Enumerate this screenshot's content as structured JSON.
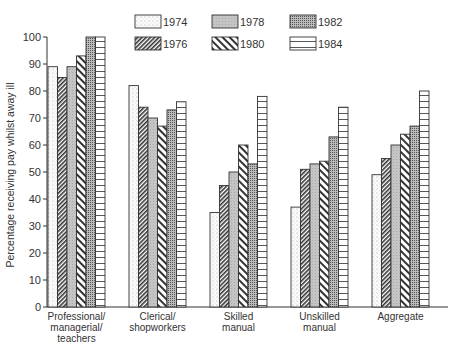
{
  "chart_data": {
    "type": "bar",
    "title": "",
    "xlabel": "",
    "ylabel": "Percentage receiving pay whilst away ill",
    "ylim": [
      0,
      100
    ],
    "yticks": [
      0,
      10,
      20,
      30,
      40,
      50,
      60,
      70,
      80,
      90,
      100
    ],
    "grid": false,
    "legend_position": "top",
    "categories": [
      [
        "Professional/",
        "managerial/",
        "teachers"
      ],
      [
        "Clerical/",
        "shopworkers"
      ],
      [
        "Skilled",
        "manual"
      ],
      [
        "Unskilled",
        "manual"
      ],
      [
        "Aggregate"
      ]
    ],
    "series": [
      {
        "name": "1974",
        "pattern": "dots",
        "values": [
          89,
          82,
          35,
          37,
          49
        ]
      },
      {
        "name": "1976",
        "pattern": "dense-diagonal",
        "values": [
          85,
          74,
          45,
          51,
          55
        ]
      },
      {
        "name": "1978",
        "pattern": "light-grey",
        "values": [
          89,
          70,
          50,
          53,
          60
        ]
      },
      {
        "name": "1980",
        "pattern": "wide-diagonal",
        "values": [
          93,
          67,
          60,
          54,
          64
        ]
      },
      {
        "name": "1982",
        "pattern": "dark-stipple",
        "values": [
          100,
          73,
          53,
          63,
          67
        ]
      },
      {
        "name": "1984",
        "pattern": "horizontal-lines",
        "values": [
          100,
          76,
          78,
          74,
          80
        ]
      }
    ]
  }
}
